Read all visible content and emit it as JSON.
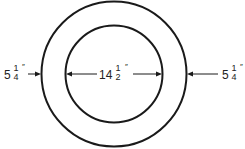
{
  "diagram": {
    "type": "concentric-circles-dimension",
    "colors": {
      "stroke": "#1a1a1a",
      "background": "#ffffff"
    },
    "outer_circle": {
      "cx": 114,
      "cy": 74,
      "r": 73
    },
    "inner_circle": {
      "cx": 114,
      "cy": 74,
      "r": 49
    },
    "dimensions": {
      "left": {
        "whole": "5",
        "numerator": "1",
        "denominator": "4",
        "unit": "″"
      },
      "center": {
        "whole": "14",
        "numerator": "1",
        "denominator": "2",
        "unit": "″"
      },
      "right": {
        "whole": "5",
        "numerator": "1",
        "denominator": "4",
        "unit": "″"
      }
    }
  }
}
